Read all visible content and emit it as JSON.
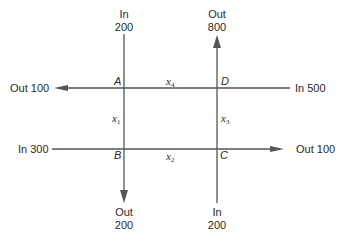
{
  "diagram": {
    "type": "traffic-flow-network",
    "nodes": [
      {
        "id": "A",
        "label": "A"
      },
      {
        "id": "B",
        "label": "B"
      },
      {
        "id": "C",
        "label": "C"
      },
      {
        "id": "D",
        "label": "D"
      }
    ],
    "internal_edges": [
      {
        "from": "A",
        "to": "B",
        "variable": "x",
        "subscript": "1"
      },
      {
        "from": "B",
        "to": "C",
        "variable": "x",
        "subscript": "2"
      },
      {
        "from": "C",
        "to": "D",
        "variable": "x",
        "subscript": "3"
      },
      {
        "from": "D",
        "to": "A",
        "variable": "x",
        "subscript": "4"
      }
    ],
    "external_flows": {
      "A_top": {
        "direction": "In",
        "value": "200"
      },
      "A_left": {
        "direction": "Out",
        "value": "100",
        "text": "Out 100"
      },
      "D_top": {
        "direction": "Out",
        "value": "800"
      },
      "D_right": {
        "direction": "In",
        "value": "500",
        "text": "In 500"
      },
      "B_left": {
        "direction": "In",
        "value": "300",
        "text": "In 300"
      },
      "B_bottom": {
        "direction": "Out",
        "value": "200"
      },
      "C_right": {
        "direction": "Out",
        "value": "100",
        "text": "Out 100"
      },
      "C_bottom": {
        "direction": "In",
        "value": "200"
      }
    }
  }
}
